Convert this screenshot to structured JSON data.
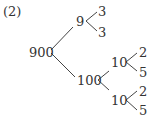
{
  "label": "(2)",
  "tree": {
    "root": "900",
    "level1": [
      "9",
      "100"
    ],
    "nine_children": [
      "3",
      "3"
    ],
    "hundred_children": [
      "10",
      "10"
    ],
    "ten_a_children": [
      "2",
      "5"
    ],
    "ten_b_children": [
      "2",
      "5"
    ]
  }
}
